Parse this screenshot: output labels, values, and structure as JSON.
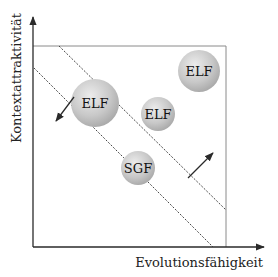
{
  "diagram": {
    "x_axis_label": "Evolutionsfähigkeit",
    "y_axis_label": "Kontextattraktivität",
    "colors": {
      "axis": "#2a2a2a",
      "frame": "#8a8a8a",
      "dashed_line": "#333333",
      "bubble_light": "#e6e6e6",
      "bubble_dark": "#a8a8a8"
    },
    "bubbles": [
      {
        "label": "ELF",
        "cx": 95,
        "cy": 103,
        "r": 24
      },
      {
        "label": "ELF",
        "cx": 199,
        "cy": 71,
        "r": 21
      },
      {
        "label": "ELF",
        "cx": 158,
        "cy": 114,
        "r": 17
      },
      {
        "label": "SGF",
        "cx": 138,
        "cy": 168,
        "r": 17
      }
    ],
    "dashed_lines": [
      {
        "x1": 59,
        "y1": 46,
        "x2": 226,
        "y2": 210
      },
      {
        "x1": 34,
        "y1": 68,
        "x2": 213,
        "y2": 247
      }
    ],
    "arrows": [
      {
        "direction": "down-left",
        "x1": 74,
        "y1": 97,
        "x2": 56,
        "y2": 121
      },
      {
        "direction": "up-right",
        "x1": 188,
        "y1": 178,
        "x2": 213,
        "y2": 153
      }
    ]
  }
}
